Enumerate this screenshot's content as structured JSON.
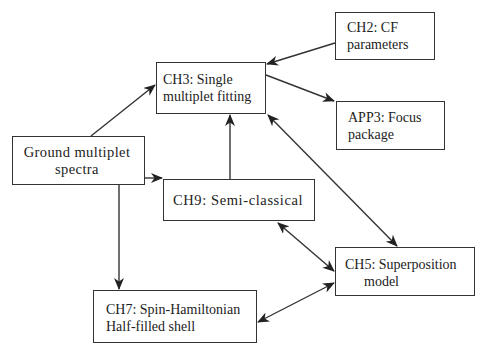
{
  "diagram": {
    "type": "flowchart",
    "line_color": "#333333",
    "nodes": {
      "ch2": {
        "line1": "CH2: CF",
        "line2": "parameters"
      },
      "ch3": {
        "line1": "CH3: Single",
        "line2": "multiplet fitting"
      },
      "app3": {
        "line1": "APP3: Focus",
        "line2": "package"
      },
      "ground": {
        "line1": "Ground multiplet",
        "line2": "spectra"
      },
      "ch9": {
        "line1": "CH9: Semi-classical"
      },
      "ch5": {
        "line1": "CH5: Superposition",
        "line2": "model"
      },
      "ch7": {
        "line1": "CH7: Spin-Hamiltonian",
        "line2": "Half-filled shell"
      }
    },
    "edges": [
      {
        "from": "ground",
        "to": "ch3",
        "direction": "forward"
      },
      {
        "from": "ch2",
        "to": "ch3",
        "direction": "forward"
      },
      {
        "from": "ch3",
        "to": "app3",
        "direction": "forward"
      },
      {
        "from": "ground",
        "to": "ch9",
        "direction": "forward"
      },
      {
        "from": "ch9",
        "to": "ch3",
        "direction": "forward"
      },
      {
        "from": "ground",
        "to": "ch7",
        "direction": "forward"
      },
      {
        "from": "ch3",
        "to": "ch5",
        "direction": "both"
      },
      {
        "from": "ch9",
        "to": "ch5",
        "direction": "both"
      },
      {
        "from": "ch7",
        "to": "ch5",
        "direction": "both"
      }
    ]
  }
}
